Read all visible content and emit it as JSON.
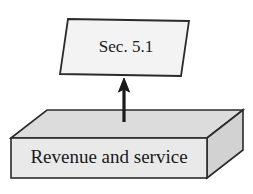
{
  "diagram": {
    "background_color": "#ffffff",
    "stroke_color": "#1a1a1a",
    "nodes": [
      {
        "id": "sec-node",
        "shape": "parallelogram",
        "label": "Sec. 5.1",
        "fill_color": "#f2f2f2",
        "stroke_color": "#2b2b2b",
        "x": 60,
        "y": 18,
        "width": 128,
        "height": 58
      },
      {
        "id": "revenue-node",
        "shape": "cuboid-3d",
        "label": "Revenue and service",
        "fill_color": "#e8e8e8",
        "top_face_color": "#dcdcdc",
        "side_face_color": "#d2d2d2",
        "stroke_color": "#2b2b2b",
        "x": 11,
        "y": 110,
        "width": 196,
        "height": 68,
        "depth_x": 36,
        "depth_y": 28
      }
    ],
    "connectors": [
      {
        "id": "arrow-revenue-to-sec",
        "type": "arrow",
        "from": "revenue-node",
        "to": "sec-node",
        "direction": "up",
        "color": "#1a1a1a",
        "x": 124,
        "y_start": 122,
        "y_end": 79
      }
    ]
  }
}
